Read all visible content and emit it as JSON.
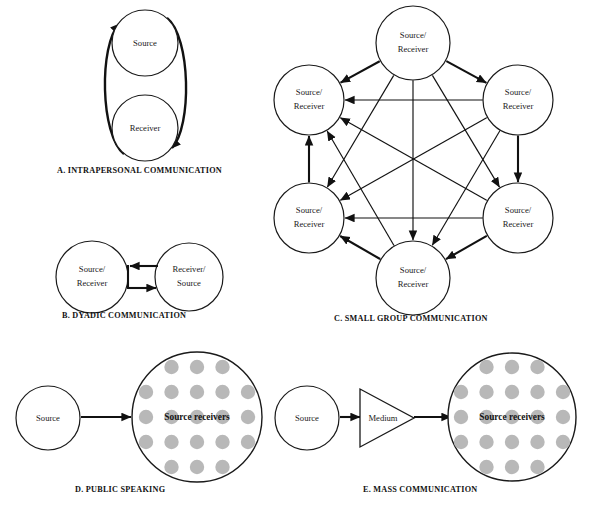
{
  "figure": {
    "title_present": false,
    "background_color": "#ffffff",
    "stroke_color": "#111111",
    "dot_color": "#b8b8b8"
  },
  "panels": [
    {
      "id": "a",
      "caption": "A. INTRAPERSONAL COMMUNICATION",
      "caption_x": 57,
      "caption_y": 173,
      "nodes": [
        {
          "name": "source",
          "label_lines": [
            "Source"
          ],
          "cx": 145,
          "cy": 43,
          "r": 33
        },
        {
          "name": "receiver",
          "label_lines": [
            "Receiver"
          ],
          "cx": 145,
          "cy": 128,
          "r": 33
        }
      ],
      "curves": [
        {
          "name": "receiver-to-source-curve",
          "d": "M 124 154 C 100 135 99 45 119 24",
          "arrow_at": "end"
        },
        {
          "name": "source-to-receiver-curve",
          "d": "M 167 18 C 191 37 192 127 172 148",
          "arrow_at": "end"
        }
      ]
    },
    {
      "id": "b",
      "caption": "B. DYADIC COMMUNICATION",
      "caption_x": 62,
      "caption_y": 318,
      "nodes": [
        {
          "name": "source-receiver",
          "label_lines": [
            "Source/",
            "Receiver"
          ],
          "cx": 92,
          "cy": 277,
          "r": 36
        },
        {
          "name": "receiver-source",
          "label_lines": [
            "Receiver/",
            "Source"
          ],
          "cx": 189,
          "cy": 277,
          "r": 34
        }
      ],
      "arrows": [
        {
          "name": "right-to-left-arrow",
          "x1": 156,
          "y1": 266,
          "x2": 129,
          "y2": 266
        },
        {
          "name": "left-to-right-arrow",
          "x1": 129,
          "y1": 288,
          "x2": 156,
          "y2": 288
        }
      ],
      "connector": {
        "x": 128,
        "y1": 266,
        "y2": 288
      }
    },
    {
      "id": "c",
      "caption": "C. SMALL GROUP COMMUNICATION",
      "caption_x": 334,
      "caption_y": 321,
      "nodes": [
        {
          "name": "node-top",
          "label_lines": [
            "Source/",
            "Receiver"
          ],
          "cx": 413,
          "cy": 43,
          "r": 37
        },
        {
          "name": "node-upper-right",
          "label_lines": [
            "Source/",
            "Receiver"
          ],
          "cx": 518,
          "cy": 100,
          "r": 35
        },
        {
          "name": "node-lower-right",
          "label_lines": [
            "Source/",
            "Receiver"
          ],
          "cx": 518,
          "cy": 218,
          "r": 35
        },
        {
          "name": "node-bottom",
          "label_lines": [
            "Source/",
            "Receiver"
          ],
          "cx": 413,
          "cy": 278,
          "r": 37
        },
        {
          "name": "node-lower-left",
          "label_lines": [
            "Source/",
            "Receiver"
          ],
          "cx": 309,
          "cy": 218,
          "r": 35
        },
        {
          "name": "node-upper-left",
          "label_lines": [
            "Source/",
            "Receiver"
          ],
          "cx": 309,
          "cy": 100,
          "r": 35
        }
      ],
      "edges_bidirectional": [
        [
          0,
          1
        ],
        [
          0,
          2
        ],
        [
          0,
          3
        ],
        [
          0,
          4
        ],
        [
          0,
          5
        ],
        [
          1,
          2
        ],
        [
          1,
          3
        ],
        [
          1,
          4
        ],
        [
          1,
          5
        ],
        [
          2,
          3
        ],
        [
          2,
          4
        ],
        [
          2,
          5
        ],
        [
          3,
          4
        ],
        [
          3,
          5
        ],
        [
          4,
          5
        ]
      ],
      "edge_count": 15
    },
    {
      "id": "d",
      "caption": "D. PUBLIC SPEAKING",
      "caption_x": 75,
      "caption_y": 492,
      "nodes": [
        {
          "name": "source",
          "label_lines": [
            "Source"
          ],
          "cx": 48,
          "cy": 418,
          "r": 32
        }
      ],
      "audience": {
        "name": "source-receivers",
        "label": "Source receivers",
        "cx": 197,
        "cy": 417,
        "r": 65,
        "dot_rows": [
          3,
          5,
          5,
          5,
          3
        ],
        "dot_count": 21,
        "dot_radius": 7.2
      },
      "arrows": [
        {
          "name": "source-to-audience-arrow",
          "x1": 81,
          "y1": 417,
          "x2": 130,
          "y2": 417
        }
      ]
    },
    {
      "id": "e",
      "caption": "E. MASS COMMUNICATION",
      "caption_x": 363,
      "caption_y": 492,
      "nodes": [
        {
          "name": "source",
          "label_lines": [
            "Source"
          ],
          "cx": 307,
          "cy": 418,
          "r": 32
        }
      ],
      "medium": {
        "name": "medium-triangle",
        "label": "Medium",
        "x_left": 360,
        "x_apex": 414,
        "y_top": 389,
        "y_bottom": 447,
        "label_x": 382,
        "label_y": 418
      },
      "audience": {
        "name": "source-receivers",
        "label": "Source receivers",
        "cx": 512,
        "cy": 417,
        "r": 64,
        "dot_rows": [
          3,
          5,
          5,
          5,
          3
        ],
        "dot_count": 21,
        "dot_radius": 7.2
      },
      "arrows": [
        {
          "name": "source-to-medium-arrow",
          "x1": 340,
          "y1": 417,
          "x2": 359,
          "y2": 417
        },
        {
          "name": "medium-to-audience-arrow",
          "x1": 414,
          "y1": 417,
          "x2": 450,
          "y2": 417
        }
      ]
    }
  ]
}
